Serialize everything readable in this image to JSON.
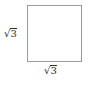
{
  "figure": {
    "type": "square-diagram",
    "background_color": "#ffffff",
    "shape": {
      "name": "square",
      "stroke_color": "#9a9a9a",
      "fill_color": "#ffffff",
      "stroke_width": 1
    },
    "labels": [
      {
        "position": "left",
        "text": "√3",
        "radical_sign": "√",
        "radicand": "3",
        "color": "#2b2b2b"
      },
      {
        "position": "bottom",
        "text": "√3",
        "radical_sign": "√",
        "radicand": "3",
        "color": "#2b2b2b"
      }
    ]
  }
}
